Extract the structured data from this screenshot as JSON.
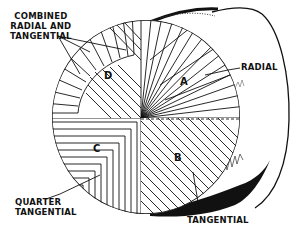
{
  "labels": {
    "combined": [
      "COMBINED",
      "RADIAL AND",
      "TANGENTIAL"
    ],
    "radial": "RADIAL",
    "quarter_tangential": [
      "QUARTER",
      "TANGENTIAL"
    ],
    "tangential": "TANGENTIAL"
  },
  "segments": {
    "a": "A",
    "b": "B",
    "c": "C",
    "d": "D"
  },
  "segment_meaning": {
    "A": "Radial",
    "B": "Tangential",
    "C": "Quarter tangential",
    "D": "Combined radial and tangential"
  },
  "colors": {
    "ink": "#111111",
    "paper": "#ffffff"
  }
}
